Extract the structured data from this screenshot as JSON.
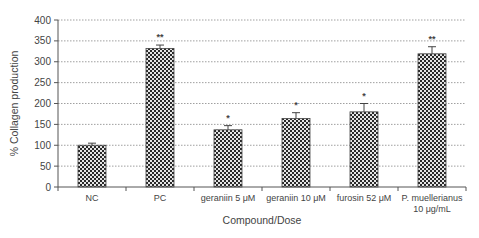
{
  "chart_data": {
    "type": "bar",
    "title": "",
    "xlabel": "Compound/Dose",
    "ylabel": "% Collagen production",
    "ylim": [
      0,
      400
    ],
    "yticks": [
      0,
      50,
      100,
      150,
      200,
      250,
      300,
      350,
      400
    ],
    "grid": "horizontal dotted",
    "legend": null,
    "categories": [
      "NC",
      "PC",
      "geraniin 5 μM",
      "geraniin 10 μM",
      "furosin 52 μM",
      "P. muellerianus 10 μg/mL"
    ],
    "category_lines": [
      [
        "NC"
      ],
      [
        "PC"
      ],
      [
        "geraniin 5 μM"
      ],
      [
        "geraniin 10 μM"
      ],
      [
        "furosin 52 μM"
      ],
      [
        "P. muellerianus",
        "10 μg/mL"
      ]
    ],
    "values": [
      100,
      332,
      137,
      164,
      180,
      319
    ],
    "errors": [
      5,
      8,
      10,
      14,
      20,
      17
    ],
    "significance": [
      "",
      "**",
      "*",
      "*",
      "*",
      "**"
    ],
    "bar_pattern": "checkerboard",
    "colors": {
      "bar_dark": "#2a2a2a",
      "bar_light": "#e6e6e6",
      "grid": "#888888",
      "axis": "#555555"
    }
  }
}
